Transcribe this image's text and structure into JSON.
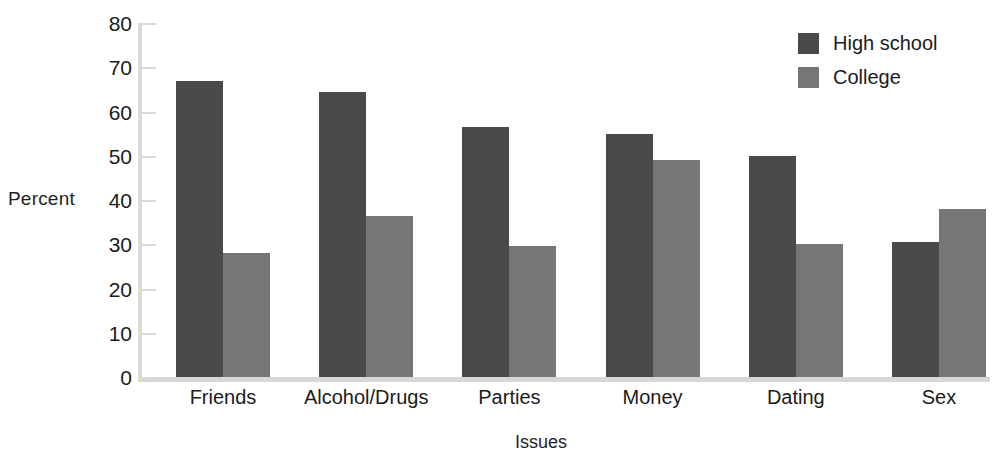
{
  "chart_data": {
    "type": "bar",
    "title": "",
    "subtitle": "",
    "xlabel": "Issues",
    "ylabel": "Percent",
    "categories": [
      "Friends",
      "Alcohol/Drugs",
      "Parties",
      "Money",
      "Dating",
      "Sex"
    ],
    "series": [
      {
        "name": "High school",
        "color": "#4a4a4a",
        "values": [
          67,
          64.5,
          56.5,
          55,
          50,
          30.5
        ]
      },
      {
        "name": "College",
        "color": "#767676",
        "values": [
          28,
          36.5,
          29.5,
          49,
          30,
          38
        ]
      }
    ],
    "ylim": [
      0,
      80
    ],
    "y_ticks": [
      0,
      10,
      20,
      30,
      40,
      50,
      60,
      70,
      80
    ],
    "y_tick_labels": [
      "0",
      "10",
      "20",
      "30",
      "40",
      "50",
      "60",
      "70",
      "80"
    ],
    "grid": false,
    "legend_position": "top-right",
    "annotations": []
  },
  "axes": {
    "y_label_text": "Percent",
    "x_label_text": "Issues",
    "axis_color": "#d9d9d9"
  },
  "legend": {
    "entries": [
      {
        "label": "High school",
        "color": "#4a4a4a"
      },
      {
        "label": "College",
        "color": "#767676"
      }
    ]
  }
}
